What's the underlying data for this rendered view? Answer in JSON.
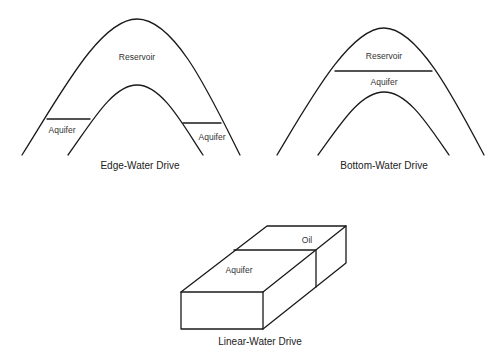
{
  "diagrams": [
    {
      "id": "edge",
      "caption": "Edge-Water Drive",
      "labels": {
        "reservoir": "Reservoir",
        "aquifer_left": "Aquifer",
        "aquifer_right": "Aquifer"
      }
    },
    {
      "id": "bottom",
      "caption": "Bottom-Water Drive",
      "labels": {
        "reservoir": "Reservoir",
        "aquifer": "Aquifer"
      }
    },
    {
      "id": "linear",
      "caption": "Linear-Water Drive",
      "labels": {
        "oil": "Oil",
        "aquifer": "Aquifer"
      }
    }
  ],
  "colors": {
    "line": "#1a1a1a",
    "text": "#333333",
    "background": "#ffffff"
  }
}
